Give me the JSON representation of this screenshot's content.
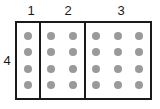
{
  "diagram": {
    "type": "partitioned-dot-grid",
    "rows": 4,
    "row_label": "4",
    "sections": [
      {
        "label": "1",
        "columns": 1
      },
      {
        "label": "2",
        "columns": 2
      },
      {
        "label": "3",
        "columns": 3
      }
    ],
    "colors": {
      "dot": "#9a9a9a",
      "border": "#1a1a1a",
      "background": "#ffffff",
      "label_text": "#1a1a1a"
    }
  }
}
